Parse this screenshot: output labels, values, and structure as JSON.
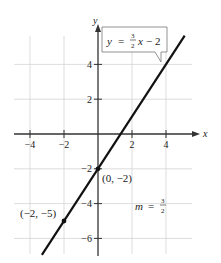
{
  "chart_data": {
    "type": "line",
    "title": "",
    "xlabel": "x",
    "ylabel": "y",
    "xlim": [
      -5,
      5.9
    ],
    "ylim": [
      -7.1,
      5.7
    ],
    "grid": true,
    "x_ticks": [
      -4,
      -2,
      2,
      4
    ],
    "x_tick_labels": [
      "−4",
      "−2",
      "2",
      "4"
    ],
    "y_ticks": [
      4,
      2,
      -2,
      -4,
      -6
    ],
    "y_tick_labels": [
      "4",
      "2",
      "−2",
      "−4",
      "−6"
    ],
    "series": [
      {
        "name": "y = (3/2)x − 2",
        "equation": "y = 3/2 x − 2",
        "slope": 1.5,
        "intercept": -2,
        "x": [
          -3.3,
          5.1
        ],
        "y": [
          -6.95,
          5.65
        ]
      }
    ],
    "points": [
      {
        "x": 0,
        "y": -2,
        "label": "(0, −2)"
      },
      {
        "x": -2,
        "y": -5,
        "label": "(−2, −5)"
      }
    ],
    "annotations": [
      {
        "text": "y = 3/2 x − 2",
        "type": "callout"
      },
      {
        "text": "m = 3/2",
        "type": "label"
      }
    ],
    "colors": {
      "line": "#111111",
      "grid": "#d4d4d4",
      "axis": "#333333"
    }
  },
  "labels": {
    "x_axis": "x",
    "y_axis": "y",
    "callout_y": "y",
    "callout_eq": "=",
    "callout_num": "3",
    "callout_den": "2",
    "callout_x": "x",
    "callout_rest": "− 2",
    "point_a": "(0, −2)",
    "point_b": "(−2, −5)",
    "slope_m": "m",
    "slope_eq": "=",
    "slope_num": "3",
    "slope_den": "2"
  }
}
